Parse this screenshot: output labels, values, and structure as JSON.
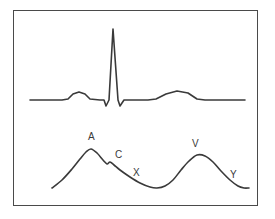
{
  "figure": {
    "background_color": "#ffffff",
    "frame_color": "#4a4a4a",
    "trace_color": "#3a3a3a",
    "label_color": "#3a3a3a"
  },
  "chart_data": {
    "type": "line",
    "xlabel": "",
    "ylabel": "",
    "grid": false,
    "legend": "none",
    "axis_ranges": {
      "x": [
        0,
        275
      ],
      "y": [
        0,
        219
      ]
    },
    "series": [
      {
        "name": "ECG",
        "description": "Electrocardiogram tracing: baseline, P wave, QRS complex (Q dip, tall R spike, S dip), T wave",
        "points": [
          [
            30,
            100
          ],
          [
            62,
            100
          ],
          [
            68,
            99
          ],
          [
            73,
            94
          ],
          [
            79,
            92
          ],
          [
            85,
            94
          ],
          [
            90,
            99
          ],
          [
            100,
            100
          ],
          [
            104,
            100
          ],
          [
            106,
            106
          ],
          [
            109,
            100
          ],
          [
            113,
            29
          ],
          [
            118,
            100
          ],
          [
            120,
            106
          ],
          [
            124,
            100
          ],
          [
            148,
            100
          ],
          [
            156,
            99
          ],
          [
            166,
            94
          ],
          [
            177,
            91
          ],
          [
            188,
            93
          ],
          [
            197,
            99
          ],
          [
            205,
            100
          ],
          [
            245,
            100
          ]
        ],
        "features": [
          {
            "name": "P wave",
            "x": 79,
            "y": 92
          },
          {
            "name": "Q",
            "x": 106,
            "y": 106
          },
          {
            "name": "R",
            "x": 113,
            "y": 29
          },
          {
            "name": "S",
            "x": 120,
            "y": 106
          },
          {
            "name": "T wave",
            "x": 177,
            "y": 91
          }
        ]
      },
      {
        "name": "Jugular venous pulse",
        "description": "Venous pressure tracing showing A wave, C wave, X descent, V wave and Y descent",
        "points": [
          [
            52,
            188
          ],
          [
            62,
            180
          ],
          [
            72,
            169
          ],
          [
            80,
            159
          ],
          [
            86,
            152
          ],
          [
            91,
            149
          ],
          [
            97,
            153
          ],
          [
            103,
            160
          ],
          [
            107,
            164
          ],
          [
            110,
            162
          ],
          [
            114,
            165
          ],
          [
            120,
            170
          ],
          [
            130,
            177
          ],
          [
            140,
            183
          ],
          [
            150,
            187
          ],
          [
            157,
            188
          ],
          [
            165,
            186
          ],
          [
            173,
            180
          ],
          [
            181,
            170
          ],
          [
            189,
            161
          ],
          [
            197,
            155
          ],
          [
            205,
            156
          ],
          [
            213,
            162
          ],
          [
            221,
            171
          ],
          [
            230,
            180
          ],
          [
            238,
            186
          ],
          [
            244,
            188
          ],
          [
            249,
            188
          ]
        ],
        "features": [
          {
            "name": "A wave peak",
            "x": 91,
            "y": 149
          },
          {
            "name": "C wave notch",
            "x": 110,
            "y": 162
          },
          {
            "name": "X descent trough",
            "x": 157,
            "y": 188
          },
          {
            "name": "V wave peak",
            "x": 197,
            "y": 155
          },
          {
            "name": "Y descent",
            "x": 238,
            "y": 186
          }
        ]
      }
    ],
    "annotations": [
      {
        "text": "A",
        "x": 88,
        "y": 132
      },
      {
        "text": "C",
        "x": 115,
        "y": 150
      },
      {
        "text": "X",
        "x": 133,
        "y": 168
      },
      {
        "text": "V",
        "x": 192,
        "y": 139
      },
      {
        "text": "Y",
        "x": 230,
        "y": 170
      }
    ]
  },
  "labels": {
    "a_wave": "A",
    "c_wave": "C",
    "x_descent": "X",
    "v_wave": "V",
    "y_descent": "Y"
  }
}
